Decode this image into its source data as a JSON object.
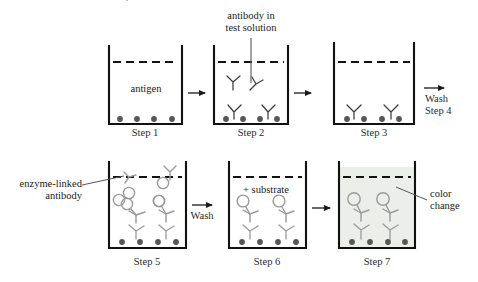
{
  "diagram": {
    "colors": {
      "outline": "#111111",
      "antigen_dot": "#565656",
      "antibody_dark": "#3b3b3b",
      "antibody_gray": "#9a9a9a",
      "enzyme_ring": "#9a9a9a",
      "color_change_fill": "#eceee9",
      "text": "#1a1a1a"
    },
    "wells": [
      {
        "id": "well-step-1",
        "step_label": "Step 1",
        "inner_label": "antigen",
        "antigen_dots": 4,
        "antibodies_dark": 0,
        "antibodies_enzyme": 0,
        "fluid_fill": false
      },
      {
        "id": "well-step-2",
        "step_label": "Step 2",
        "inner_label": "",
        "antigen_dots": 4,
        "antibodies_dark": 4,
        "antibodies_enzyme": 0,
        "fluid_fill": false
      },
      {
        "id": "well-step-3",
        "step_label": "Step 3",
        "inner_label": "",
        "antigen_dots": 4,
        "antibodies_dark": 2,
        "antibodies_enzyme": 0,
        "fluid_fill": false
      },
      {
        "id": "well-step-5",
        "step_label": "Step 5",
        "inner_label": "",
        "antigen_dots": 4,
        "antibodies_dark": 2,
        "antibodies_enzyme": 6,
        "fluid_fill": false
      },
      {
        "id": "well-step-6",
        "step_label": "Step 6",
        "inner_label": "+ substrate",
        "antigen_dots": 4,
        "antibodies_dark": 2,
        "antibodies_enzyme": 2,
        "fluid_fill": false
      },
      {
        "id": "well-step-7",
        "step_label": "Step 7",
        "inner_label": "",
        "antigen_dots": 4,
        "antibodies_dark": 2,
        "antibodies_enzyme": 2,
        "fluid_fill": true
      }
    ],
    "annotations": {
      "antibody_in_test_solution_line1": "antibody in",
      "antibody_in_test_solution_line2": "test solution",
      "antigen": "antigen",
      "enzyme_linked_line1": "enzyme-linked",
      "enzyme_linked_line2": "antibody",
      "substrate": "+ substrate",
      "color_change_line1": "color",
      "color_change_line2": "change"
    },
    "arrows": [
      {
        "id": "arrow-step1-to-step2",
        "label": ""
      },
      {
        "id": "arrow-step2-to-step3",
        "label": ""
      },
      {
        "id": "arrow-wash-step4-line1",
        "label": "Wash"
      },
      {
        "id": "arrow-wash-step4-line2",
        "label": "Step 4"
      },
      {
        "id": "arrow-step5-to-step6",
        "label": "Wash"
      },
      {
        "id": "arrow-step6-to-step7",
        "label": ""
      }
    ]
  }
}
